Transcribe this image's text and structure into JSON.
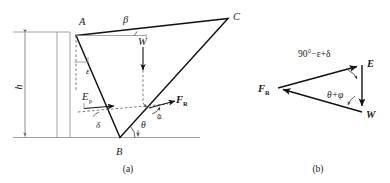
{
  "figure": {
    "panels": [
      {
        "id": "a",
        "caption": "(a)",
        "description": "Failure-wedge free body of retaining wall backfill"
      },
      {
        "id": "b",
        "caption": "(b)",
        "description": "Closed force polygon (force triangle)"
      }
    ]
  },
  "panel_a": {
    "vertex_labels": {
      "A": "A",
      "B": "B",
      "C": "C"
    },
    "angle_labels": {
      "beta": "β",
      "epsilon": "ε",
      "delta": "δ",
      "theta": "θ",
      "phi": "φ"
    },
    "force_labels": {
      "weight": "W",
      "earth_pressure": "E",
      "earth_pressure_subscript": "p",
      "resultant": "F",
      "resultant_subscript": "R"
    },
    "dimension_labels": {
      "height": "h"
    }
  },
  "panel_b": {
    "vertex_labels": {
      "resultant": "F",
      "resultant_subscript": "R",
      "earth_pressure": "E",
      "weight": "W"
    },
    "angle_labels": {
      "top": "90°−ε+δ",
      "bottom": "θ+φ"
    }
  },
  "colors": {
    "stroke_main": "#111111",
    "stroke_thin": "#8a8a8a",
    "stroke_dashed": "#5a5a5a",
    "text": "#1a1a1a",
    "background": "#ffffff"
  }
}
